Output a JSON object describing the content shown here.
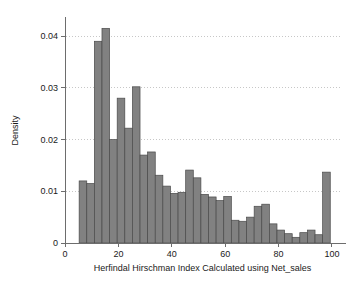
{
  "chart_data": {
    "type": "bar",
    "title": "",
    "subtitle": "",
    "xlabel": "Herfindal Hirschman Index Calculated using Net_sales",
    "ylabel": "Density",
    "xlim": [
      0,
      103
    ],
    "ylim": [
      0,
      0.0435
    ],
    "grid": true,
    "legend": null,
    "bar_style": "histogram",
    "bin_width": 2.85,
    "x_ticks": [
      0,
      20,
      40,
      60,
      80,
      100
    ],
    "x_tick_labels": [
      "0",
      "20",
      "40",
      "60",
      "80",
      "100"
    ],
    "y_ticks": [
      0,
      0.01,
      0.02,
      0.03,
      0.04
    ],
    "y_tick_labels": [
      "0",
      "0.01",
      "0.02",
      "0.03",
      "0.04"
    ],
    "bin_starts": [
      5.3,
      8.15,
      11.0,
      13.85,
      16.7,
      19.55,
      22.4,
      25.25,
      28.1,
      30.95,
      33.8,
      36.65,
      39.5,
      42.35,
      45.2,
      48.05,
      50.9,
      53.75,
      56.6,
      59.45,
      62.3,
      65.15,
      68.0,
      70.85,
      73.7,
      76.55,
      79.4,
      82.25,
      85.1,
      87.95,
      90.8,
      93.65,
      96.5
    ],
    "values": [
      0.012,
      0.0115,
      0.039,
      0.0415,
      0.02,
      0.028,
      0.0222,
      0.0302,
      0.017,
      0.0176,
      0.0131,
      0.011,
      0.0096,
      0.0098,
      0.0141,
      0.0126,
      0.0094,
      0.0089,
      0.0082,
      0.009,
      0.0044,
      0.0042,
      0.005,
      0.0071,
      0.0075,
      0.0037,
      0.0025,
      0.0018,
      0.0011,
      0.002,
      0.0025,
      0.0016,
      0.0137
    ],
    "colors": {
      "bar_fill": "#818181",
      "bar_stroke": "#4a4a4a",
      "axis": "#6d6d6d",
      "grid": "#b9b9b9",
      "text": "#1a1a1a",
      "background": "#ffffff"
    }
  },
  "figure": {
    "plot_area": {
      "left": 65,
      "right": 340,
      "top": 18,
      "bottom": 243
    }
  }
}
